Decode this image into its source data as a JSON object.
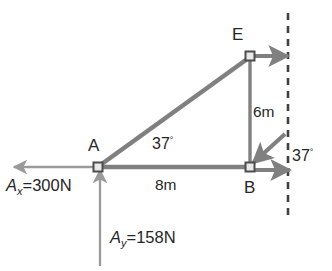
{
  "figure": {
    "type": "free-body-diagram",
    "background_color": "#ffffff",
    "line_color": "#808080",
    "thin_line_color": "#9a9a9a",
    "text_color": "#262626",
    "marker_fill": "#e8e8e8",
    "marker_stroke": "#4d4d4d"
  },
  "nodes": [
    {
      "id": "A",
      "label": "A",
      "x": 98,
      "y": 167
    },
    {
      "id": "B",
      "label": "B",
      "x": 250,
      "y": 167
    },
    {
      "id": "E",
      "label": "E",
      "x": 250,
      "y": 56
    }
  ],
  "members": [
    {
      "from": "A",
      "to": "B",
      "name": "bottom-chord"
    },
    {
      "from": "A",
      "to": "E",
      "name": "diagonal-chord"
    },
    {
      "from": "E",
      "to": "B",
      "name": "vertical-chord"
    }
  ],
  "dimensions": [
    {
      "name": "horizontal-span",
      "label": "8m",
      "value": 8,
      "unit": "m",
      "between": [
        "A",
        "B"
      ]
    },
    {
      "name": "vertical-height",
      "label": "6m",
      "value": 6,
      "unit": "m",
      "between": [
        "E",
        "B"
      ]
    }
  ],
  "angles": [
    {
      "name": "interior-angle-at-A",
      "value": 37,
      "unit": "deg",
      "number": "37",
      "degree_symbol": "°"
    },
    {
      "name": "angle-at-wall",
      "value": 37,
      "unit": "deg",
      "number": "37",
      "degree_symbol": "°"
    }
  ],
  "forces": [
    {
      "name": "reaction-Ax",
      "symbol": "A",
      "subscript": "x",
      "equals": "=",
      "magnitude": "300",
      "unit": "N",
      "label": "A_x=300N",
      "direction": "left",
      "at": "A"
    },
    {
      "name": "reaction-Ay",
      "symbol": "A",
      "subscript": "y",
      "equals": "=",
      "magnitude": "158",
      "unit": "N",
      "label": "A_y=158N",
      "direction": "up",
      "at": "A"
    },
    {
      "name": "force-at-E",
      "direction": "right",
      "at": "E",
      "label": ""
    },
    {
      "name": "force-at-B-horizontal",
      "direction": "right",
      "at": "B",
      "label": ""
    },
    {
      "name": "force-at-B-inclined",
      "direction": "down-left",
      "at": "B",
      "label": ""
    }
  ],
  "wall": {
    "name": "reference-dashed-line",
    "orientation": "vertical",
    "x": 288,
    "y_top": 13,
    "y_bottom": 216,
    "style": "dashed"
  }
}
